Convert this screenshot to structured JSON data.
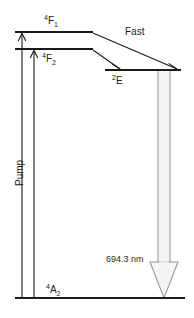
{
  "figure": {
    "type": "energy-level-diagram",
    "background_color": "#ffffff",
    "line_color": "#1a1a1a",
    "laser_arrow_color": "#9a9a9a"
  },
  "levels": [
    {
      "id": "F1",
      "name": "upper-pump-band-F1",
      "label_main": "F",
      "label_sup": "4",
      "label_sub": "1",
      "label_text": "4F1",
      "x1": 15,
      "x2": 93,
      "y": 32
    },
    {
      "id": "F2",
      "name": "upper-pump-band-F2",
      "label_main": "F",
      "label_sup": "4",
      "label_sub": "2",
      "label_text": "4F2",
      "x1": 15,
      "x2": 93,
      "y": 49
    },
    {
      "id": "E",
      "name": "metastable-level-E",
      "label_main": "E",
      "label_sup": "2",
      "label_sub": "",
      "label_text": "2E",
      "x1": 105,
      "x2": 181,
      "y": 70
    },
    {
      "id": "A2",
      "name": "ground-level-A2",
      "label_main": "A",
      "label_sup": "4",
      "label_sub": "2",
      "label_text": "4A2",
      "x1": 15,
      "x2": 185,
      "y": 298
    }
  ],
  "transitions": {
    "pump": {
      "label": "Pump",
      "arrow_1": {
        "x": 22,
        "y_from": 298,
        "y_to": 33
      },
      "arrow_2": {
        "x": 34,
        "y_from": 298,
        "y_to": 50
      }
    },
    "relaxation": {
      "label": "Fast",
      "arrow_1": {
        "x_from": 93,
        "y_from": 33,
        "x_to": 176,
        "y_to": 69
      },
      "arrow_2": {
        "x_from": 93,
        "y_from": 50,
        "x_to": 119,
        "y_to": 69
      }
    },
    "lasing": {
      "wavelength": "694.3",
      "unit": "nm",
      "label": "694.3  nm",
      "x_center": 164,
      "y_from": 70,
      "y_to": 298
    }
  }
}
